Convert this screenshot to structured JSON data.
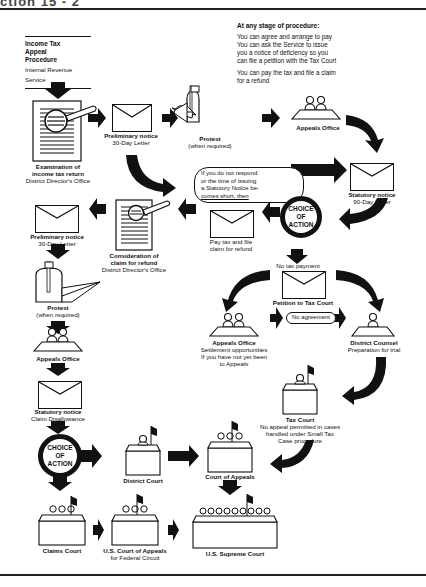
{
  "page": {
    "header_fragment": "ction 15 - 2"
  },
  "title_block": {
    "line1": "Income Tax",
    "line2": "Appeal",
    "line3": "Procedure",
    "subtitle": "Internal Revenue Service"
  },
  "legend": {
    "title": "At any stage of procedure:",
    "items": [
      "You can agree and arrange to pay",
      "You can ask the Service to issue",
      "you a notice of deficiency so you",
      "can file a petition with the Tax Court",
      "You can pay the tax and file a claim",
      "for a refund"
    ]
  },
  "nodes": {
    "examination": {
      "title1": "Examination of",
      "title2": "income tax return",
      "sub": "District Director's Office"
    },
    "prelim_top": {
      "title": "Preliminary notice",
      "sub": "30-Day Letter"
    },
    "protest_top": {
      "title": "Protest",
      "sub": "(when required)"
    },
    "appeals_top": {
      "title": "Appeals Office"
    },
    "bubble": {
      "lines": [
        "If you do not respond",
        "or the time of issuing",
        "a Statutory Notice be-",
        "comes short, then"
      ]
    },
    "statutory_top": {
      "title": "Statutory notice",
      "sub": "90-Day Letter"
    },
    "choice_top": {
      "line1": "CHOICE",
      "line2": "OF",
      "line3": "ACTION"
    },
    "pay_tax": {
      "line1": "Pay tax and file",
      "line2": "claim for refund"
    },
    "consideration": {
      "title1": "Consideration of",
      "title2": "claim for refund",
      "sub": "District Director's Office"
    },
    "prelim_left": {
      "title": "Preliminary notice",
      "sub": "30-Day Letter"
    },
    "protest_left": {
      "title": "Protest",
      "sub": "(when required)"
    },
    "appeals_left": {
      "title": "Appeals Office"
    },
    "statutory_left": {
      "title": "Statutory notice",
      "sub": "Claim Disallowance"
    },
    "choice_left": {
      "line1": "CHOICE",
      "line2": "OF",
      "line3": "ACTION"
    },
    "no_tax": {
      "label": "No tax payment"
    },
    "petition": {
      "title": "Petition to Tax Court"
    },
    "appeals_mid": {
      "title": "Appeals Office",
      "sub1": "Settlement opportunities",
      "sub2": "If you have not yet been",
      "sub3": "to Appeals"
    },
    "no_agreement": {
      "label": "No agreement"
    },
    "district_counsel": {
      "title": "District Counsel",
      "sub": "Preparation for trial"
    },
    "tax_court": {
      "title": "Tax Court",
      "sub1": "No appeal permitted in cases",
      "sub2": "handled under Small Tax",
      "sub3": "Case procedure"
    },
    "district_court": {
      "title": "District Court"
    },
    "court_of_appeals": {
      "title": "Court of Appeals"
    },
    "claims_court": {
      "title": "Claims Court"
    },
    "us_court_appeals_fed": {
      "title": "U.S. Court of Appeals",
      "sub": "for Federal Circuit"
    },
    "supreme_court": {
      "title": "U.S. Supreme Court"
    }
  }
}
